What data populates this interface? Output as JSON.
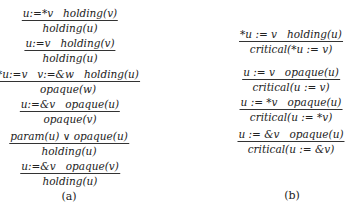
{
  "panel_a": {
    "label": "(a)",
    "rules": [
      {
        "premise": "u:=*v   holding(v)",
        "conclusion": "holding(u)"
      },
      {
        "premise": "u:=v   holding(v)",
        "conclusion": "holding(u)"
      },
      {
        "premise": "*u:=v   v:=&w   holding(u)",
        "conclusion": "opaque(w)"
      },
      {
        "premise": "u:=&v   opaque(u)",
        "conclusion": "opaque(v)"
      },
      {
        "premise": "param(u) ∨ opaque(u)",
        "conclusion": "holding(u)"
      },
      {
        "premise": "u:=&v   opaque(v)",
        "conclusion": "holding(u)"
      }
    ]
  },
  "panel_b": {
    "label": "(b)",
    "rules": [
      {
        "premise": "*u := v   holding(u)",
        "conclusion": "critical(*u := v)"
      },
      {
        "premise": "u := v   opaque(u)",
        "conclusion": "critical(u := v)"
      },
      {
        "premise": "u := *v   opaque(u)",
        "conclusion": "critical(u := *v)"
      },
      {
        "premise": "u := &v   opaque(u)",
        "conclusion": "critical(u := &v)"
      }
    ]
  }
}
